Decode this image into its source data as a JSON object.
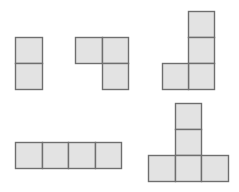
{
  "diagram": {
    "colors": {
      "fill": "#e3e3e3",
      "stroke": "#6f6f6f",
      "background": "#ffffff"
    },
    "stroke_width": 1.4,
    "shapes": [
      {
        "name": "domino-vertical",
        "cell_count": 2,
        "cells": [
          {
            "x": 15,
            "y": 37,
            "w": 27,
            "h": 26
          },
          {
            "x": 15,
            "y": 63,
            "w": 27,
            "h": 26
          }
        ]
      },
      {
        "name": "tromino-L",
        "cell_count": 3,
        "cells": [
          {
            "x": 75,
            "y": 37,
            "w": 27,
            "h": 26
          },
          {
            "x": 102,
            "y": 37,
            "w": 26,
            "h": 26
          },
          {
            "x": 102,
            "y": 63,
            "w": 26,
            "h": 26
          }
        ]
      },
      {
        "name": "tetromino-J",
        "cell_count": 4,
        "cells": [
          {
            "x": 188,
            "y": 11,
            "w": 26,
            "h": 26
          },
          {
            "x": 188,
            "y": 37,
            "w": 26,
            "h": 26
          },
          {
            "x": 188,
            "y": 63,
            "w": 26,
            "h": 26
          },
          {
            "x": 162,
            "y": 63,
            "w": 26,
            "h": 26
          }
        ]
      },
      {
        "name": "tetromino-I",
        "cell_count": 4,
        "cells": [
          {
            "x": 15,
            "y": 142,
            "w": 27,
            "h": 26
          },
          {
            "x": 42,
            "y": 142,
            "w": 26,
            "h": 26
          },
          {
            "x": 68,
            "y": 142,
            "w": 27,
            "h": 26
          },
          {
            "x": 95,
            "y": 142,
            "w": 26,
            "h": 26
          }
        ]
      },
      {
        "name": "pentomino-T",
        "cell_count": 5,
        "cells": [
          {
            "x": 175,
            "y": 103,
            "w": 26,
            "h": 26
          },
          {
            "x": 175,
            "y": 129,
            "w": 26,
            "h": 26
          },
          {
            "x": 148,
            "y": 155,
            "w": 27,
            "h": 26
          },
          {
            "x": 175,
            "y": 155,
            "w": 26,
            "h": 26
          },
          {
            "x": 201,
            "y": 155,
            "w": 27,
            "h": 26
          }
        ]
      }
    ]
  }
}
